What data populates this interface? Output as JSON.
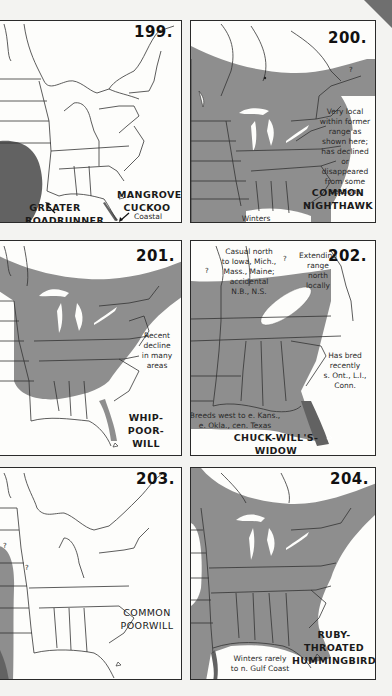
{
  "page": {
    "background": "#f3f3f1",
    "range_color": "#8e8e8e",
    "dark_range_color": "#626262",
    "map_line_color": "#333333"
  },
  "panels": [
    {
      "number": "199.",
      "species": [
        {
          "name_lines": [
            "GREATER",
            "ROADRUNNER"
          ],
          "note_lines": [
            "Extending",
            "range east"
          ]
        },
        {
          "name_lines": [
            "MANGROVE",
            "CUCKOO"
          ],
          "note_lines": [
            "Coastal",
            "mangroves"
          ]
        }
      ]
    },
    {
      "number": "200.",
      "species_lines": [
        "COMMON",
        "NIGHTHAWK"
      ],
      "notes": [
        {
          "lines": [
            "Very local",
            "within former",
            "range as",
            "shown here;",
            "has declined",
            "or disappeared",
            "from some",
            "sections"
          ]
        },
        {
          "lines": [
            "Winters",
            "S. America"
          ]
        }
      ],
      "marker": "?"
    },
    {
      "number": "201.",
      "species_lines": [
        "WHIP-POOR-",
        "WILL"
      ],
      "notes": [
        {
          "lines": [
            "Recent",
            "decline",
            "in many",
            "areas"
          ]
        }
      ]
    },
    {
      "number": "202.",
      "species_lines": [
        "CHUCK-WILL'S-",
        "WIDOW"
      ],
      "notes": [
        {
          "lines": [
            "Casual north",
            "to Iowa, Mich.,",
            "Mass., Maine;",
            "accidental",
            "N.B., N.S."
          ]
        },
        {
          "lines": [
            "Extending",
            "range",
            "north",
            "locally"
          ]
        },
        {
          "lines": [
            "Has bred",
            "recently",
            "s. Ont., L.I.,",
            "Conn."
          ]
        },
        {
          "lines": [
            "Breeds west to e. Kans.,",
            "e. Okla., cen. Texas"
          ]
        }
      ],
      "markers": [
        "?",
        "?",
        "?"
      ]
    },
    {
      "number": "203.",
      "species_lines": [
        "COMMON",
        "POORWILL"
      ],
      "markers": [
        "?",
        "?"
      ]
    },
    {
      "number": "204.",
      "species_lines": [
        "RUBY-THROATED",
        "HUMMINGBIRD"
      ],
      "notes": [
        {
          "lines": [
            "Winters rarely",
            "to n. Gulf Coast"
          ]
        }
      ]
    }
  ]
}
